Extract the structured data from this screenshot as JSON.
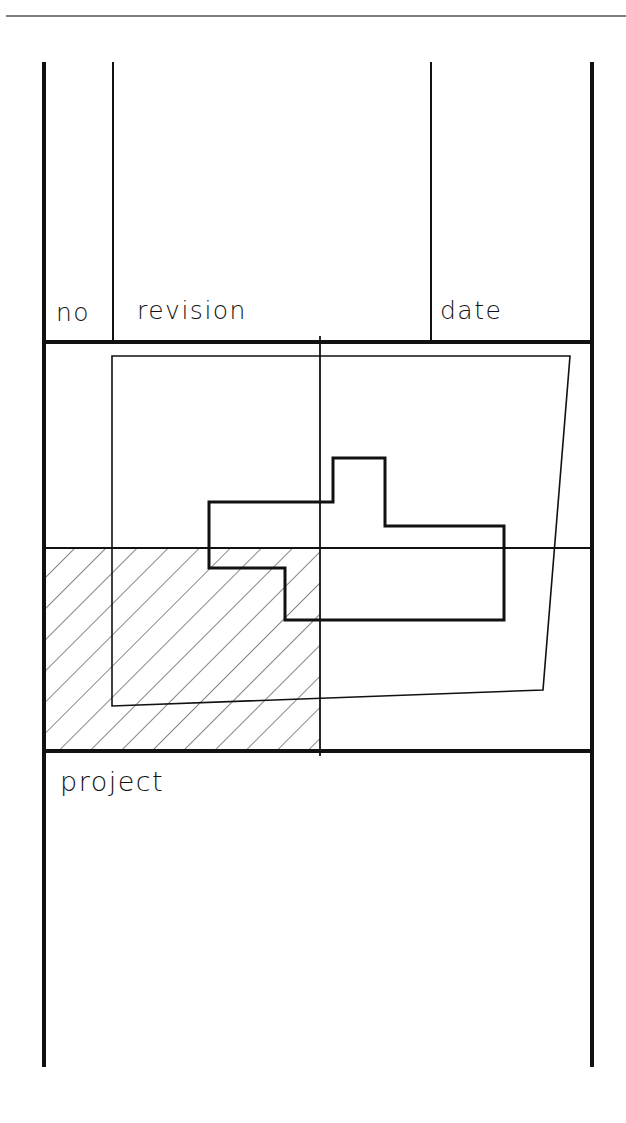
{
  "title_block": {
    "header_columns": [
      {
        "key": "no",
        "label": "no"
      },
      {
        "key": "revision",
        "label": "revision"
      },
      {
        "key": "date",
        "label": "date"
      }
    ],
    "project_label": "project"
  },
  "colors": {
    "ink": "#111111",
    "background": "#ffffff",
    "top_rule": "#555555"
  },
  "diagram": {
    "elements": [
      "top-rule",
      "outer-frame",
      "revision-table",
      "key-plan",
      "site-boundary",
      "building-footprint",
      "reference-axis-horizontal",
      "reference-axis-vertical",
      "hatched-quadrant",
      "project-area"
    ]
  }
}
